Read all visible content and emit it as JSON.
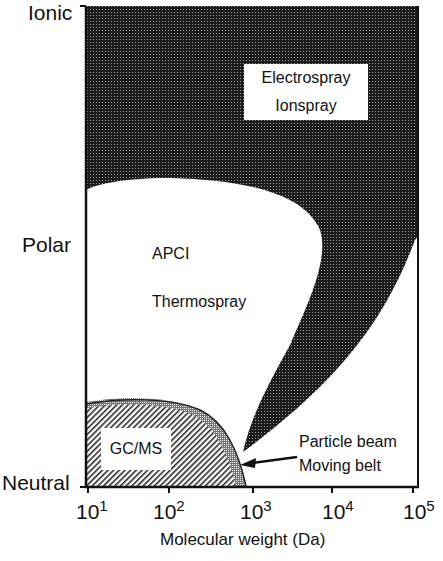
{
  "diagram": {
    "title": "",
    "y_axis": {
      "labels": [
        "Ionic",
        "Polar",
        "Neutral"
      ]
    },
    "x_axis": {
      "label": "Molecular weight (Da)",
      "ticks": [
        {
          "base": "10",
          "exp": "1"
        },
        {
          "base": "10",
          "exp": "2"
        },
        {
          "base": "10",
          "exp": "3"
        },
        {
          "base": "10",
          "exp": "4"
        },
        {
          "base": "10",
          "exp": "5"
        }
      ]
    },
    "regions": {
      "electrospray": {
        "line1": "Electrospray",
        "line2": "Ionspray"
      },
      "apci": {
        "line1": "APCI",
        "line2": "Thermospray"
      },
      "gcms": {
        "label": "GC/MS"
      },
      "particle_beam": {
        "line1": "Particle beam",
        "line2": "Moving belt"
      }
    },
    "colors": {
      "dark_fill": "#2a2a2a",
      "hatch": "#333333",
      "background": "#ffffff"
    }
  }
}
